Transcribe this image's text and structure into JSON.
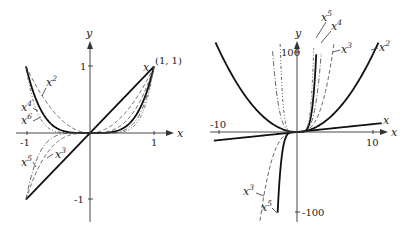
{
  "figures": [
    {
      "id": "left",
      "title": "Power functions on [-1, 1]",
      "axis_labels": {
        "x": "x",
        "y": "y"
      },
      "ticks": {
        "x": [
          "-1",
          "1"
        ],
        "y": [
          "1",
          "-1"
        ]
      },
      "point_label": "(1, 1)",
      "xlim": [
        -1,
        1
      ],
      "ylim": [
        -1,
        1
      ],
      "curves": [
        {
          "name": "x",
          "power": 1,
          "style": "solid",
          "label": "x"
        },
        {
          "name": "x2",
          "power": 2,
          "style": "dash",
          "label": "x",
          "sup": "2"
        },
        {
          "name": "x3",
          "power": 3,
          "style": "dash",
          "label": "x",
          "sup": "3"
        },
        {
          "name": "x4",
          "power": 4,
          "style": "solid",
          "label": "x",
          "sup": "4"
        },
        {
          "name": "x5",
          "power": 5,
          "style": "dashdot",
          "label": "x",
          "sup": "5"
        },
        {
          "name": "x6",
          "power": 6,
          "style": "dashdot2",
          "label": "x",
          "sup": "6"
        }
      ]
    },
    {
      "id": "right",
      "title": "Power functions on larger scale",
      "axis_labels": {
        "x": "x",
        "y": "y"
      },
      "ticks": {
        "x": [
          "-10",
          "10"
        ],
        "y": [
          "100",
          "-100"
        ]
      },
      "xlim": [
        -10,
        10
      ],
      "ylim": [
        -100,
        100
      ],
      "curves": [
        {
          "name": "x",
          "power": 1,
          "style": "solid",
          "label": "x"
        },
        {
          "name": "x2",
          "power": 2,
          "style": "solid",
          "label": "x",
          "sup": "2"
        },
        {
          "name": "x3",
          "power": 3,
          "style": "dash",
          "label": "x",
          "sup": "3"
        },
        {
          "name": "x4",
          "power": 4,
          "style": "dashdot",
          "label": "x",
          "sup": "4"
        },
        {
          "name": "x5",
          "power": 5,
          "style": "solid",
          "label": "x",
          "sup": "5"
        },
        {
          "name": "x6",
          "power": 6,
          "style": "dashdot2",
          "label": "x"
        }
      ],
      "bottom_labels": [
        {
          "label": "x",
          "sup": "3"
        },
        {
          "label": "x",
          "sup": "5"
        }
      ]
    }
  ]
}
